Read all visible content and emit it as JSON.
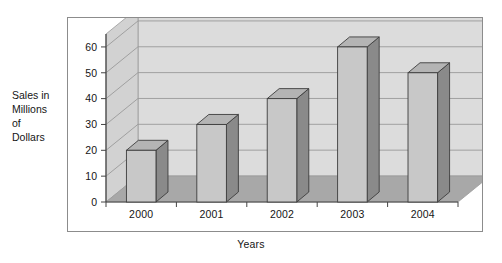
{
  "chart_data": {
    "type": "bar",
    "title": "",
    "subtitle": "",
    "xlabel": "Years",
    "ylabel": "Sales in\nMillions\nof\nDollars",
    "categories": [
      "2000",
      "2001",
      "2002",
      "2003",
      "2004"
    ],
    "values": [
      20,
      30,
      40,
      60,
      50
    ],
    "series": [
      {
        "name": "Sales",
        "values": [
          20,
          30,
          40,
          60,
          50
        ]
      }
    ],
    "ylim": [
      0,
      65
    ],
    "yticks": [
      0,
      10,
      20,
      30,
      40,
      50,
      60
    ],
    "ytick_labels": [
      "0",
      "10",
      "20",
      "30",
      "40",
      "50",
      "60"
    ],
    "grid": true,
    "grid_axis": "y",
    "legend": false,
    "legend_position": "none",
    "style": "3d-column",
    "units": "millions of dollars",
    "annotations": []
  },
  "colors": {
    "bar_front": "#c8c8c8",
    "bar_side": "#8a8a8a",
    "bar_top": "#b4b4b4",
    "bar_outline": "#3d3d3d",
    "wall_back": "#dcdcdc",
    "wall_left": "#d2d2d2",
    "floor": "#a8a8a8",
    "gridline": "#9a9a9a",
    "axis": "#444444",
    "frame_border": "#8c8c8c",
    "text": "#151515",
    "page_background": "#ffffff"
  },
  "axes": {
    "y_title_lines": [
      "Sales in",
      "Millions",
      "of",
      "Dollars"
    ],
    "x_title": "Years"
  },
  "icons": {}
}
